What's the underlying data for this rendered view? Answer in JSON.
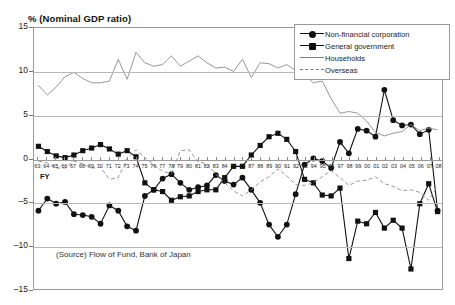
{
  "chart_data": {
    "type": "line",
    "title": "% (Nominal GDP ratio)",
    "xlabel": "FY",
    "ylabel": "",
    "ylim": [
      -15,
      15
    ],
    "yticks": [
      15,
      10,
      5,
      0,
      -5,
      -10,
      -15
    ],
    "grid": true,
    "legend_position": "top-right",
    "source": "(Source) Flow of  Fund, Bank of Japan",
    "categories": [
      "63",
      "64",
      "65",
      "66",
      "67",
      "68",
      "69",
      "70",
      "71",
      "72",
      "73",
      "74",
      "75",
      "76",
      "77",
      "78",
      "79",
      "80",
      "81",
      "82",
      "83",
      "84",
      "85",
      "86",
      "87",
      "88",
      "89",
      "90",
      "91",
      "92",
      "93",
      "94",
      "95",
      "96",
      "97",
      "98",
      "99",
      "00",
      "01",
      "02",
      "03",
      "04",
      "05",
      "06",
      "07",
      "08"
    ],
    "series": [
      {
        "name": "Non-financial corporation",
        "marker": "circle",
        "style": "solid",
        "values": [
          -6.0,
          -4.6,
          -5.2,
          -5.0,
          -6.4,
          -6.5,
          -6.7,
          -7.5,
          -5.4,
          -6.0,
          -7.8,
          -8.3,
          -4.3,
          -3.6,
          -2.3,
          -1.8,
          -2.8,
          -3.6,
          -3.3,
          -3.1,
          -1.9,
          -2.6,
          -3.0,
          -2.2,
          -3.6,
          -5.1,
          -7.6,
          -9.0,
          -7.6,
          -4.1,
          -0.7,
          0.0,
          -0.3,
          -1.1,
          1.9,
          0.6,
          3.4,
          3.2,
          2.5,
          7.9,
          4.4,
          3.8,
          3.9,
          2.8,
          3.3,
          -6.0
        ]
      },
      {
        "name": "General government",
        "marker": "square",
        "style": "solid",
        "values": [
          1.4,
          0.8,
          0.3,
          0.1,
          0.4,
          0.9,
          1.2,
          1.6,
          1.1,
          0.5,
          0.9,
          0.2,
          -2.8,
          -3.6,
          -3.8,
          -4.8,
          -4.4,
          -4.3,
          -3.8,
          -3.6,
          -3.6,
          -2.2,
          -0.9,
          -0.9,
          0.4,
          1.5,
          2.5,
          2.9,
          2.2,
          0.8,
          -2.4,
          -2.8,
          -4.2,
          -4.3,
          -3.4,
          -11.5,
          -7.2,
          -7.5,
          -6.2,
          -8.0,
          -7.1,
          -8.0,
          -12.7,
          -5.2,
          -2.9,
          -6.1
        ]
      },
      {
        "name": "Households",
        "marker": "none",
        "style": "solid",
        "values": [
          8.4,
          7.3,
          8.2,
          9.4,
          9.9,
          9.2,
          8.7,
          8.7,
          8.9,
          11.4,
          9.1,
          12.2,
          11.0,
          10.6,
          10.8,
          11.8,
          10.6,
          11.2,
          11.8,
          11.0,
          10.4,
          10.5,
          10.0,
          11.4,
          9.3,
          11.0,
          10.9,
          10.4,
          10.8,
          10.1,
          9.6,
          8.7,
          8.9,
          6.9,
          5.2,
          5.4,
          5.2,
          4.3,
          3.0,
          2.6,
          2.9,
          3.1,
          3.9,
          3.2,
          3.5,
          3.3
        ]
      },
      {
        "name": "Overseas",
        "marker": "none",
        "style": "dashed",
        "values": [
          -0.3,
          -0.5,
          -1.1,
          -1.1,
          -0.3,
          -0.6,
          -1.1,
          -1.0,
          -2.4,
          -2.2,
          0.0,
          1.0,
          0.1,
          -0.7,
          -1.5,
          -1.7,
          0.9,
          1.0,
          -0.4,
          -0.6,
          -1.8,
          -2.8,
          -3.7,
          -4.3,
          -3.6,
          -2.7,
          -2.1,
          -1.2,
          -2.0,
          -3.0,
          -3.1,
          -2.8,
          -2.1,
          -1.4,
          -2.2,
          -3.1,
          -2.6,
          -2.5,
          -2.1,
          -2.9,
          -3.2,
          -3.7,
          -3.6,
          -3.9,
          -4.8,
          -3.2
        ]
      }
    ]
  },
  "legend": {
    "items": [
      {
        "label": "Non-financial corporation"
      },
      {
        "label": "General government"
      },
      {
        "label": "Households"
      },
      {
        "label": "Overseas"
      }
    ]
  },
  "axis": {
    "fy_label": "FY"
  }
}
